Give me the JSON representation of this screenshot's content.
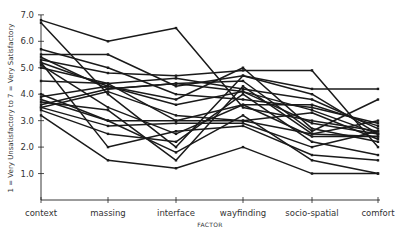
{
  "chart_data": {
    "type": "line",
    "title": "",
    "xlabel": "FACTOR",
    "ylabel": "1 = Very Unsatisfactory to 7 = Very Satisfactory",
    "ylim": [
      0,
      7
    ],
    "yticks": [
      "1.0",
      "2.0",
      "3.0",
      "4.0",
      "5.0",
      "6.0",
      "7.0"
    ],
    "categories": [
      "context",
      "massing",
      "interface",
      "wayfinding",
      "socio-spatial",
      "comfort"
    ],
    "grid": false,
    "legend": "none",
    "series": [
      {
        "name": "s1",
        "values": [
          6.8,
          6.0,
          6.5,
          3.5,
          3.0,
          2.6
        ]
      },
      {
        "name": "s2",
        "values": [
          6.7,
          4.0,
          2.0,
          4.7,
          4.0,
          2.5
        ]
      },
      {
        "name": "s3",
        "values": [
          5.7,
          5.0,
          4.0,
          3.8,
          3.5,
          2.9
        ]
      },
      {
        "name": "s4",
        "values": [
          5.5,
          5.5,
          4.3,
          4.7,
          4.2,
          4.2
        ]
      },
      {
        "name": "s5",
        "values": [
          5.4,
          4.2,
          4.4,
          4.5,
          2.6,
          3.8
        ]
      },
      {
        "name": "s6",
        "values": [
          5.3,
          4.8,
          4.7,
          4.9,
          4.9,
          2.0
        ]
      },
      {
        "name": "s7",
        "values": [
          5.2,
          4.3,
          3.6,
          4.1,
          2.9,
          2.5
        ]
      },
      {
        "name": "s8",
        "values": [
          5.1,
          3.5,
          2.5,
          3.6,
          3.6,
          2.8
        ]
      },
      {
        "name": "s9",
        "values": [
          5.0,
          4.4,
          3.0,
          3.6,
          2.4,
          2.4
        ]
      },
      {
        "name": "s10",
        "values": [
          4.5,
          4.4,
          4.6,
          4.2,
          3.8,
          2.7
        ]
      },
      {
        "name": "s11",
        "values": [
          4.0,
          3.0,
          3.0,
          3.0,
          2.5,
          3.0
        ]
      },
      {
        "name": "s12",
        "values": [
          3.9,
          4.3,
          3.8,
          5.0,
          2.7,
          2.2
        ]
      },
      {
        "name": "s13",
        "values": [
          3.7,
          3.4,
          1.5,
          4.3,
          2.5,
          2.4
        ]
      },
      {
        "name": "s14",
        "values": [
          3.6,
          4.2,
          4.4,
          4.1,
          3.4,
          2.5
        ]
      },
      {
        "name": "s15",
        "values": [
          3.5,
          4.1,
          3.2,
          3.0,
          3.3,
          2.3
        ]
      },
      {
        "name": "s16",
        "values": [
          3.4,
          2.5,
          2.2,
          4.0,
          2.2,
          1.7
        ]
      },
      {
        "name": "s17",
        "values": [
          3.8,
          3.0,
          1.8,
          3.2,
          1.5,
          1.0
        ]
      },
      {
        "name": "s18",
        "values": [
          3.2,
          1.5,
          1.2,
          2.0,
          1.0,
          1.0
        ]
      },
      {
        "name": "s19",
        "values": [
          5.2,
          2.0,
          2.6,
          2.8,
          1.7,
          1.5
        ]
      },
      {
        "name": "s20",
        "values": [
          3.5,
          2.8,
          2.9,
          2.9,
          2.0,
          2.6
        ]
      }
    ]
  }
}
